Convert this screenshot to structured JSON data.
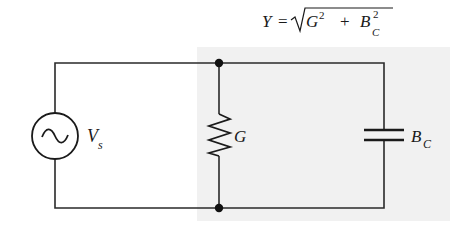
{
  "formula": {
    "lhs": "Y",
    "equals": "=",
    "radicand_term1_base": "G",
    "radicand_term1_exp": "2",
    "plus": "+",
    "radicand_term2_base": "B",
    "radicand_term2_sub": "C",
    "radicand_term2_exp": "2"
  },
  "components": {
    "source": {
      "label_base": "V",
      "label_sub": "s",
      "type": "ac-voltage-source"
    },
    "resistor": {
      "label": "G",
      "type": "conductance"
    },
    "capacitor": {
      "label_base": "B",
      "label_sub": "C",
      "type": "capacitive-susceptance"
    }
  },
  "colors": {
    "wire": "#2a2a2a",
    "shade": "#f1f1f1",
    "node": "#111111"
  }
}
